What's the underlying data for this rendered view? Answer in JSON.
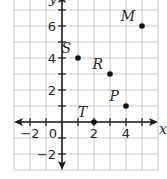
{
  "figure": {
    "type": "coordinate-plane",
    "axes": {
      "x_label": "x",
      "y_label": "y",
      "origin_label": "0",
      "x_range": [
        -3,
        6
      ],
      "y_range": [
        -3,
        8
      ],
      "x_ticks": [
        {
          "value": -2,
          "label": "−2"
        },
        {
          "value": 2,
          "label": "2"
        },
        {
          "value": 4,
          "label": "4"
        }
      ],
      "y_ticks": [
        {
          "value": -2,
          "label": "−2"
        },
        {
          "value": 2,
          "label": "2"
        },
        {
          "value": 4,
          "label": "4"
        },
        {
          "value": 6,
          "label": "6"
        }
      ]
    },
    "grid": {
      "on": true,
      "color": "#c8c8c8"
    },
    "points": [
      {
        "label": "S",
        "x": 1,
        "y": 4
      },
      {
        "label": "R",
        "x": 3,
        "y": 3
      },
      {
        "label": "P",
        "x": 4,
        "y": 1
      },
      {
        "label": "T",
        "x": 2,
        "y": 0
      },
      {
        "label": "M",
        "x": 5,
        "y": 6
      }
    ],
    "colors": {
      "axis": "#1e1e1e",
      "point": "#111111",
      "text": "#2a2a2a"
    }
  }
}
